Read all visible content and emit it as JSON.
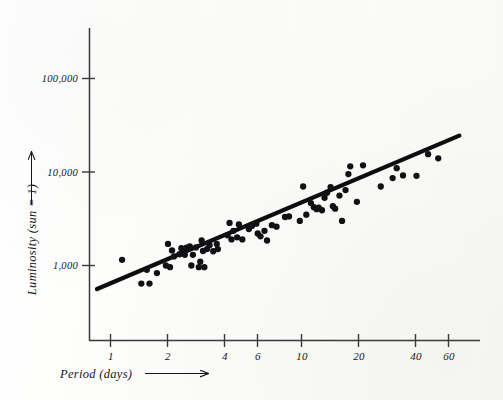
{
  "figure": {
    "background_color": "#fdfdfb",
    "ink_color": "#16161a"
  },
  "axes": {
    "x_axis_title": "Period (days)",
    "y_axis_title": "Luminosity (sun = 1)",
    "x_arrow": "right-arrow",
    "y_arrow": "up-arrow"
  },
  "chart_data": {
    "type": "scatter",
    "title": "",
    "subtitle": "",
    "xlabel": "Period (days)",
    "ylabel": "Luminosity (sun = 1)",
    "xscale": "log",
    "yscale": "log",
    "xlim": [
      0.8,
      80
    ],
    "ylim": [
      400,
      300000
    ],
    "grid": false,
    "legend": null,
    "xticks": [
      1,
      2,
      4,
      6,
      10,
      20,
      40,
      60
    ],
    "xticklabels": [
      "1",
      "2",
      "4",
      "6",
      "10",
      "20",
      "40",
      "60"
    ],
    "yticks": [
      1000,
      10000,
      100000
    ],
    "yticklabels": [
      "1,000",
      "10,000",
      "100,000"
    ],
    "annotations": [],
    "series": [
      {
        "name": "Cepheid variables",
        "type": "scatter",
        "marker": "filled-circle",
        "color": "#111115",
        "points": [
          [
            1.15,
            1150
          ],
          [
            1.45,
            640
          ],
          [
            1.55,
            900
          ],
          [
            1.6,
            640
          ],
          [
            1.75,
            830
          ],
          [
            1.95,
            1000
          ],
          [
            2.0,
            1700
          ],
          [
            2.05,
            960
          ],
          [
            2.1,
            1450
          ],
          [
            2.15,
            1250
          ],
          [
            2.3,
            1320
          ],
          [
            2.35,
            1530
          ],
          [
            2.45,
            1300
          ],
          [
            2.5,
            1550
          ],
          [
            2.6,
            1600
          ],
          [
            2.65,
            1000
          ],
          [
            2.7,
            1300
          ],
          [
            2.8,
            1560
          ],
          [
            2.9,
            960
          ],
          [
            2.95,
            1100
          ],
          [
            3.0,
            1850
          ],
          [
            3.05,
            1430
          ],
          [
            3.1,
            960
          ],
          [
            3.2,
            1500
          ],
          [
            3.3,
            1650
          ],
          [
            3.45,
            1420
          ],
          [
            3.6,
            1700
          ],
          [
            3.65,
            1500
          ],
          [
            4.1,
            2100
          ],
          [
            4.2,
            2850
          ],
          [
            4.3,
            1900
          ],
          [
            4.4,
            2350
          ],
          [
            4.6,
            2000
          ],
          [
            4.7,
            2750
          ],
          [
            4.9,
            1900
          ],
          [
            5.3,
            2450
          ],
          [
            5.5,
            2650
          ],
          [
            5.8,
            2800
          ],
          [
            5.9,
            2200
          ],
          [
            6.1,
            2050
          ],
          [
            6.4,
            2350
          ],
          [
            6.6,
            1850
          ],
          [
            7.0,
            2700
          ],
          [
            7.4,
            2600
          ],
          [
            8.2,
            3300
          ],
          [
            8.6,
            3350
          ],
          [
            9.8,
            3000
          ],
          [
            10.2,
            7000
          ],
          [
            10.6,
            3500
          ],
          [
            11.2,
            4650
          ],
          [
            11.6,
            4200
          ],
          [
            12.0,
            4000
          ],
          [
            12.3,
            4150
          ],
          [
            12.8,
            3900
          ],
          [
            13.2,
            5300
          ],
          [
            13.6,
            6000
          ],
          [
            14.2,
            6900
          ],
          [
            14.6,
            4300
          ],
          [
            15.0,
            4050
          ],
          [
            15.8,
            5600
          ],
          [
            16.3,
            3000
          ],
          [
            17.0,
            6400
          ],
          [
            17.6,
            9500
          ],
          [
            18.0,
            11500
          ],
          [
            19.5,
            4800
          ],
          [
            21.0,
            11800
          ],
          [
            26.0,
            7000
          ],
          [
            30.0,
            8600
          ],
          [
            31.5,
            11000
          ],
          [
            34.0,
            9200
          ],
          [
            40.0,
            9100
          ],
          [
            46.0,
            15500
          ],
          [
            52.0,
            14000
          ]
        ]
      },
      {
        "name": "Best-fit line",
        "type": "line",
        "color": "#0d0d10",
        "endpoints": [
          [
            0.85,
            560
          ],
          [
            67.0,
            24500
          ]
        ]
      }
    ]
  }
}
